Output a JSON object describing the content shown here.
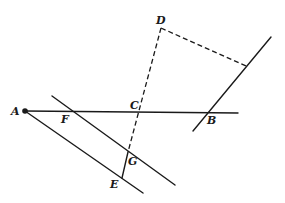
{
  "diagram": {
    "type": "geometry-figure",
    "points": {
      "A": {
        "label": "A",
        "x": 25,
        "y": 111
      },
      "B": {
        "label": "B",
        "x": 208,
        "y": 112
      },
      "C": {
        "label": "C",
        "x": 140,
        "y": 111
      },
      "D": {
        "label": "D",
        "x": 161,
        "y": 28
      },
      "E": {
        "label": "E",
        "x": 123,
        "y": 177
      },
      "F": {
        "label": "F",
        "x": 70,
        "y": 111
      },
      "G": {
        "label": "G",
        "x": 128,
        "y": 152
      }
    },
    "labels": {
      "A": "A",
      "B": "B",
      "C": "C",
      "D": "D",
      "E": "E",
      "F": "F",
      "G": "G"
    },
    "segments": [
      {
        "name": "line-AB",
        "style": "solid",
        "from": [
          25,
          111
        ],
        "to": [
          238,
          113
        ]
      },
      {
        "name": "line-A-lower",
        "style": "solid",
        "from": [
          25,
          111
        ],
        "to": [
          143,
          193
        ]
      },
      {
        "name": "line-F-upper",
        "style": "solid",
        "from": [
          52,
          96
        ],
        "to": [
          175,
          185
        ]
      },
      {
        "name": "line-through-B",
        "style": "solid",
        "from": [
          271,
          37
        ],
        "to": [
          193,
          131
        ]
      },
      {
        "name": "segment-GE",
        "style": "solid",
        "from": [
          128,
          152
        ],
        "to": [
          122,
          178
        ]
      },
      {
        "name": "dashed-DG",
        "style": "dashed",
        "from": [
          161,
          28
        ],
        "to": [
          128,
          152
        ]
      },
      {
        "name": "dashed-D-to-line",
        "style": "dashed",
        "from": [
          161,
          28
        ],
        "to": [
          246,
          66
        ]
      }
    ]
  }
}
